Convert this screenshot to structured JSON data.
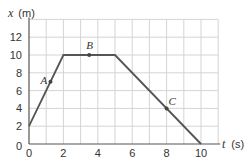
{
  "chart_data": {
    "type": "line",
    "title": "",
    "xlabel": "t (s)",
    "ylabel": "x (m)",
    "xlim": [
      0,
      11
    ],
    "ylim": [
      0,
      14
    ],
    "grid": true,
    "x_ticks": [
      0,
      2,
      4,
      6,
      8,
      10
    ],
    "y_ticks": [
      0,
      2,
      4,
      6,
      8,
      10,
      12
    ],
    "series": [
      {
        "name": "position",
        "x": [
          0,
          2,
          5,
          10
        ],
        "y": [
          2,
          10,
          10,
          0
        ],
        "color": "#555555"
      }
    ],
    "annotations": [
      {
        "label": "A",
        "x": 1.25,
        "y": 7
      },
      {
        "label": "B",
        "x": 3.5,
        "y": 10
      },
      {
        "label": "C",
        "x": 8,
        "y": 4
      }
    ]
  },
  "labels": {
    "y_var": "x",
    "y_unit": "(m)",
    "x_var": "t",
    "x_unit": "(s)"
  }
}
